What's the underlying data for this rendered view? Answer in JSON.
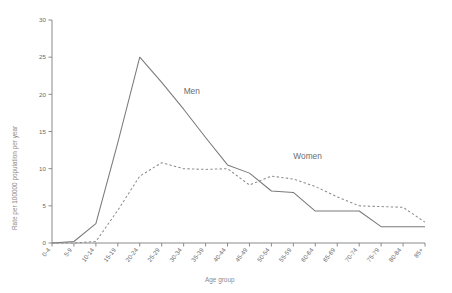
{
  "chart_data": {
    "type": "line",
    "title": "",
    "xlabel": "Age group",
    "ylabel": "Rate per 100000 population per year",
    "ylim": [
      0,
      30
    ],
    "yticks": [
      0,
      5,
      10,
      15,
      20,
      25,
      30
    ],
    "grid": false,
    "legend_position": "inline-annotation",
    "categories": [
      "0-4",
      "5-9",
      "10-14",
      "15-19",
      "20-24",
      "25-29",
      "30-34",
      "35-39",
      "40-44",
      "45-49",
      "50-54",
      "55-59",
      "60-64",
      "65-69",
      "70-74",
      "75-79",
      "80-84",
      "85+"
    ],
    "series": [
      {
        "name": "Men",
        "style": "solid",
        "color": "#7a7a7a",
        "values": [
          0,
          0.2,
          2.6,
          13.5,
          25.0,
          21.6,
          18.0,
          14.2,
          10.5,
          9.4,
          7.0,
          6.8,
          4.3,
          4.3,
          4.3,
          2.2,
          2.2,
          2.2
        ]
      },
      {
        "name": "Women",
        "style": "dashed",
        "color": "#8d8d8d",
        "values": [
          0,
          0,
          0.2,
          4.4,
          9.0,
          10.8,
          10.0,
          9.9,
          10.0,
          7.8,
          9.0,
          8.6,
          7.6,
          6.2,
          5.0,
          4.9,
          4.8,
          2.8
        ]
      }
    ],
    "annotations": [
      {
        "text": "Men",
        "category": "30-34",
        "value": 20.0
      },
      {
        "text": "Women",
        "category": "55-59",
        "value": 11.3
      }
    ]
  },
  "axis": {
    "x_title": "Age group",
    "y_title": "Rate per 100000 population per year"
  }
}
